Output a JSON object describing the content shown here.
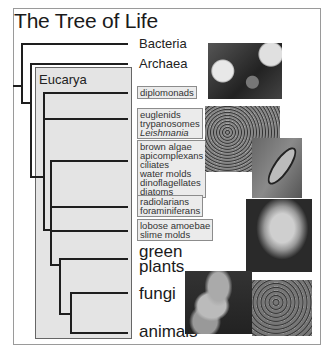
{
  "title": "The Tree of Life",
  "groups": {
    "eucarya_label": "Eucarya"
  },
  "taxa": {
    "bacteria": "Bacteria",
    "archaea": "Archaea",
    "green_plants": [
      "green",
      "plants"
    ],
    "fungi": "fungi",
    "animals": "animals"
  },
  "boxes": [
    {
      "id": "diplomonads",
      "lines": [
        "diplomonads"
      ]
    },
    {
      "id": "excavates",
      "lines": [
        "euglenids",
        "trypanosomes",
        "Leishmania"
      ],
      "italic_index": 2
    },
    {
      "id": "chromalveolates",
      "lines": [
        "brown algae",
        "apicomplexans",
        "ciliates",
        "water molds",
        "dinoflagellates",
        "diatoms"
      ]
    },
    {
      "id": "rhizaria",
      "lines": [
        "radiolarians",
        "foraminiferans"
      ]
    },
    {
      "id": "amoebozoa",
      "lines": [
        "lobose amoebae",
        "slime molds"
      ]
    }
  ],
  "photos": [
    {
      "id": "bacteria-photo",
      "depicts": "bacteria micrograph"
    },
    {
      "id": "euglenid-photo",
      "depicts": "protist micrograph"
    },
    {
      "id": "diatom-photo",
      "depicts": "diatom"
    },
    {
      "id": "orchid-photo",
      "depicts": "orchid flower"
    },
    {
      "id": "fungi-photo",
      "depicts": "mushrooms"
    },
    {
      "id": "leopard-photo",
      "depicts": "leopard"
    }
  ],
  "colors": {
    "eucarya_fill": "#e4e4e4",
    "tag_fill": "#ebebeb",
    "branch": "#1e1e1e",
    "frame": "#9a9a9a"
  }
}
